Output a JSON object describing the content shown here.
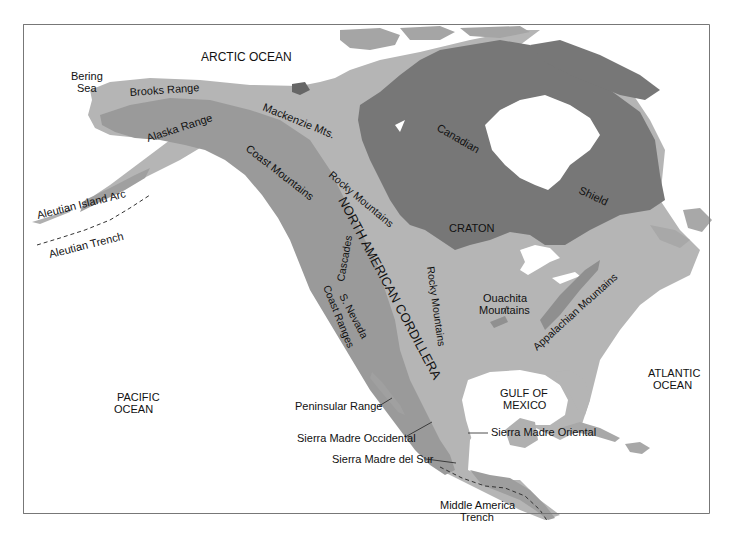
{
  "figure": {
    "type": "physiographic map",
    "region": "North America"
  },
  "colors": {
    "ocean": "#ffffff",
    "cordillera": "#9a9a9a",
    "craton_lowland": "#b8b8b8",
    "canadian_shield": "#7a7a7a",
    "arctic_islands_light": "#a8a8a8",
    "text": "#111111",
    "frame": "#777777"
  },
  "labels": {
    "oceans": {
      "arctic": "ARCTIC OCEAN",
      "bering_line1": "Bering",
      "bering_line2": "Sea",
      "pacific_line1": "PACIFIC",
      "pacific_line2": "OCEAN",
      "atlantic_line1": "ATLANTIC",
      "atlantic_line2": "OCEAN",
      "gulf_line1": "GULF OF",
      "gulf_line2": "MEXICO"
    },
    "features": {
      "brooks_range": "Brooks Range",
      "alaska_range": "Alaska Range",
      "mackenzie_mts": "Mackenzie Mts.",
      "coast_mountains": "Coast  Mountains",
      "rocky_mountains_north": "Rocky Mountains",
      "north_american_cordillera": "NORTH AMERICAN CORDILLERA",
      "cascades": "Cascades",
      "s_nevada": "S. Nevada",
      "coast_ranges": "Coast Ranges",
      "rocky_mountains_south": "Rocky Mountains",
      "aleutian_island_arc": "Aleutian Island Arc",
      "aleutian_trench": "Aleutian Trench",
      "canadian": "Canadian",
      "shield": "Shield",
      "craton": "CRATON",
      "ouachita_line1": "Ouachita",
      "ouachita_line2": "Mountains",
      "appalachian_mountains": "Appalachian Mountains",
      "peninsular_range": "Peninsular Range",
      "sierra_madre_occidental": "Sierra Madre Occidental",
      "sierra_madre_oriental": "Sierra Madre Oriental",
      "sierra_madre_del_sur": "Sierra Madre del Sur",
      "middle_america_line1": "Middle America",
      "middle_america_line2": "Trench"
    }
  }
}
